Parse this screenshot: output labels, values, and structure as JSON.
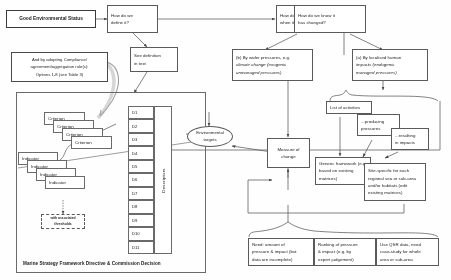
{
  "diagram": {
    "accent_color": "#5a5a5a",
    "background": "#ffffff"
  },
  "nodes": {
    "ges": {
      "label": "Good Environmental Status"
    },
    "define": {
      "line1": "How do we",
      "line2": "define it?"
    },
    "when_met": {
      "line1": "How do we know",
      "line2": "when it is met?"
    },
    "has_changed": {
      "line1": "How do we know it",
      "line2": "has changed?"
    },
    "see_definition": {
      "line1": "See definition",
      "line2": "in text"
    },
    "rule": {
      "line1": "And by adopting Compliance/",
      "line2": "agreement/aggregation rule(s):",
      "line3": "Options 1-8 (see Table 3)"
    },
    "wider_pressures": {
      "line1": "(b) By wider pressures, e.g.",
      "line2": "climate change (exogenic",
      "line3": "unmanaged pressures)"
    },
    "localised_impacts": {
      "line1": "(a) By localised human",
      "line2": "impacts (endogenic",
      "line3": "managed pressures)"
    },
    "env_targets": {
      "line1": "Environmental",
      "line2": "targets"
    },
    "measure_of_change": {
      "line1": "Measure of",
      "line2": "change"
    },
    "list_activities": {
      "label": "List of activities"
    },
    "producing_pressures": {
      "line1": "...producing",
      "line2": "pressures"
    },
    "resulting_impacts": {
      "line1": "...resulting",
      "line2": "in impacts"
    },
    "generic_framework": {
      "line1": "Generic framework (e.g.",
      "line2": "based on existing",
      "line3": "matrices)"
    },
    "site_specific": {
      "line1": "Site-specific for each",
      "line2": "regional sea or sub-area",
      "line3": "and/or habitats (edit",
      "line4": "existing matrices)"
    },
    "need_amount": {
      "line1": "Need: amount of",
      "line2": "pressure & impact (but",
      "line3": "data are incomplete)"
    },
    "ranking": {
      "line1": "Ranking of pressure",
      "line2": "& impact (e.g. by",
      "line3": "expert judgement)"
    },
    "qsr": {
      "line1": "Use QSR data, need",
      "line2": "case-study for whole",
      "line3": "area or sub-area"
    },
    "thresholds": {
      "line1": "with associated",
      "line2": "thresholds"
    }
  },
  "panel": {
    "caption": "Marine Strategy Framework Directive & Commission Decision",
    "descriptors_label": "Descriptors",
    "descriptors": [
      "D1",
      "D2",
      "D3",
      "D4",
      "D5",
      "D6",
      "D7",
      "D8",
      "D9",
      "D10",
      "D11"
    ],
    "criteria": [
      "Criterion",
      "Criterion",
      "Criterion",
      "Criterion"
    ],
    "indicators": [
      "Indicator",
      "Indicator",
      "Indicator",
      "Indicator"
    ]
  }
}
